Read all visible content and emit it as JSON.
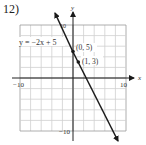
{
  "problem_number": "12)",
  "chart_data": {
    "type": "line",
    "title": "",
    "xlabel": "x",
    "ylabel": "y",
    "xlim": [
      -10,
      10
    ],
    "ylim": [
      -10,
      10
    ],
    "grid": true,
    "grid_step": 2,
    "x_tick_labels": [
      "-10",
      "10"
    ],
    "y_tick_labels": [
      "10",
      "-10"
    ],
    "series": [
      {
        "name": "y = -2x + 5",
        "equation": "y = −2x + 5",
        "slope": -2,
        "intercept": 5,
        "x": [
          -3.8,
          0,
          1,
          8.5
        ],
        "y": [
          12.6,
          5,
          3,
          -12
        ],
        "arrows_both_ends": true
      }
    ],
    "annotations": [
      {
        "label": "(0, 5)",
        "x": 0,
        "y": 5
      },
      {
        "label": "(1, 3)",
        "x": 1,
        "y": 3
      },
      {
        "label": "y = −2x + 5",
        "x": -10,
        "y": 6
      }
    ]
  },
  "labels": {
    "equation": "y = −2x + 5",
    "point1": "(0, 5)",
    "point2": "(1, 3)",
    "x_axis": "x",
    "y_axis": "y",
    "x_min": "−10",
    "x_max": "10",
    "y_max": "10",
    "y_min": "−10"
  },
  "colors": {
    "grid_light": "#cfcfcf",
    "grid_dark": "#9a9a9a",
    "axis": "#222222",
    "line": "#1a1a1a",
    "text": "#333333"
  }
}
